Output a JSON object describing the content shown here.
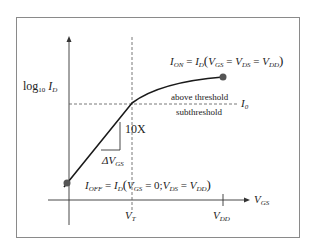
{
  "figure": {
    "y_axis_label": {
      "main": "log",
      "sub": "10",
      "var": "I",
      "var_sub": "D"
    },
    "x_axis_label": {
      "var": "V",
      "var_sub": "GS"
    },
    "x_ticks": [
      {
        "var": "V",
        "sub": "T"
      },
      {
        "var": "V",
        "sub": "DD"
      }
    ],
    "i_on_label": {
      "lhs": "I",
      "lhs_sub": "ON",
      "eq": "=",
      "fn": "I",
      "fn_sub": "D",
      "args": "(V_GS = V_DS = V_DD)",
      "a1": "V",
      "a1s": "GS",
      "a2": "V",
      "a2s": "DS",
      "a3": "V",
      "a3s": "DD"
    },
    "i_off_label": {
      "lhs": "I",
      "lhs_sub": "OFF",
      "eq": "=",
      "fn": "I",
      "fn_sub": "D",
      "a1": "V",
      "a1s": "GS",
      "a1v": "= 0;",
      "a2": "V",
      "a2s": "DS",
      "a3": "V",
      "a3s": "DD"
    },
    "threshold_line_label": {
      "var": "I",
      "sub": "0"
    },
    "above_label": "above threshold",
    "below_label": "subthreshold",
    "slope_vertical_label": "10X",
    "slope_horizontal_label": {
      "prefix": "ΔV",
      "sub": "GS"
    },
    "colors": {
      "line": "#222222",
      "frame": "#888888",
      "dot": "#555555"
    }
  }
}
